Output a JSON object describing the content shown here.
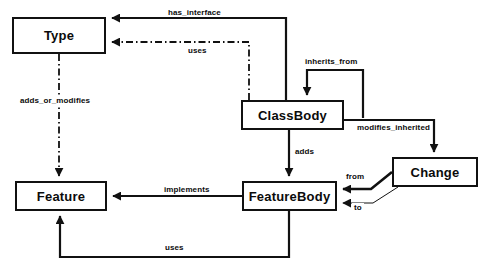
{
  "diagram": {
    "colors": {
      "stroke": "#111111",
      "fill": "#ffffff",
      "text": "#0b0b0b"
    },
    "nodes": [
      {
        "id": "type",
        "label": "Type",
        "x": 12,
        "y": 17,
        "w": 94,
        "h": 37
      },
      {
        "id": "classbody",
        "label": "ClassBody",
        "x": 241,
        "y": 100,
        "w": 103,
        "h": 30
      },
      {
        "id": "feature",
        "label": "Feature",
        "x": 15,
        "y": 181,
        "w": 92,
        "h": 30
      },
      {
        "id": "featurebody",
        "label": "FeatureBody",
        "x": 242,
        "y": 181,
        "w": 95,
        "h": 30
      },
      {
        "id": "change",
        "label": "Change",
        "x": 392,
        "y": 157,
        "w": 86,
        "h": 30
      }
    ],
    "edges": [
      {
        "id": "has-interface",
        "label": "has_interface",
        "from": "classbody",
        "to": "type",
        "style": "solid",
        "label_x": 166,
        "label_y": 8
      },
      {
        "id": "uses-type",
        "label": "uses",
        "from": "classbody",
        "to": "type",
        "style": "dashdot",
        "label_x": 186,
        "label_y": 46
      },
      {
        "id": "adds-or-modifies",
        "label": "adds_or_modifies",
        "from": "type",
        "to": "feature",
        "style": "dashdot",
        "label_x": 18,
        "label_y": 96
      },
      {
        "id": "inherits-from",
        "label": "inherits_from",
        "from": "classbody",
        "to": "classbody",
        "style": "solid",
        "label_x": 303,
        "label_y": 57
      },
      {
        "id": "modifies-inherited",
        "label": "modifies_inherited",
        "from": "classbody",
        "to": "change",
        "style": "solid",
        "label_x": 355,
        "label_y": 123
      },
      {
        "id": "adds",
        "label": "adds",
        "from": "classbody",
        "to": "featurebody",
        "style": "solid",
        "label_x": 293,
        "label_y": 147
      },
      {
        "id": "implements",
        "label": "implements",
        "from": "featurebody",
        "to": "feature",
        "style": "solid",
        "label_x": 162,
        "label_y": 185
      },
      {
        "id": "from",
        "label": "from",
        "from": "change",
        "to": "featurebody",
        "style": "solid",
        "label_x": 344,
        "label_y": 172
      },
      {
        "id": "to",
        "label": "to",
        "from": "change",
        "to": "featurebody",
        "style": "thin",
        "label_x": 352,
        "label_y": 203
      },
      {
        "id": "uses-feature",
        "label": "uses",
        "from": "featurebody",
        "to": "feature",
        "style": "solid",
        "label_x": 163,
        "label_y": 243
      }
    ]
  }
}
